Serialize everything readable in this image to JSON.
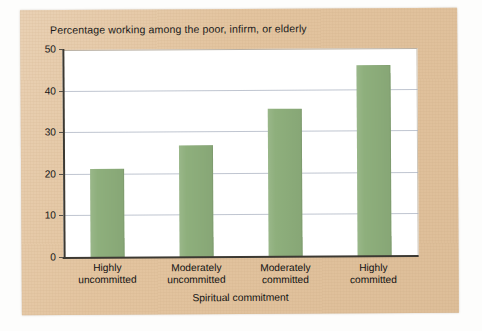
{
  "chart_data": {
    "type": "bar",
    "title": "Percentage working among the poor, infirm, or elderly",
    "xlabel": "Spiritual commitment",
    "ylabel": "",
    "categories": [
      "Highly\nuncommitted",
      "Moderately\nuncommitted",
      "Moderately\ncommitted",
      "Highly\ncommitted"
    ],
    "category_lines": [
      [
        "Highly",
        "uncommitted"
      ],
      [
        "Moderately",
        "uncommitted"
      ],
      [
        "Moderately",
        "committed"
      ],
      [
        "Highly",
        "committed"
      ]
    ],
    "values": [
      21.5,
      27,
      35.5,
      46
    ],
    "ylim": [
      0,
      50
    ],
    "ytick_labels": [
      "0",
      "10",
      "20",
      "30",
      "40",
      "50"
    ],
    "ytick_values": [
      0,
      10,
      20,
      30,
      40,
      50
    ],
    "grid": true,
    "legend": "none",
    "bar_color": "#8eaf7c",
    "plot_background": "#ffffff",
    "card_background": "#e3c49f",
    "gridline_color": "#a9b2c0",
    "axis_color": "#3c3932"
  }
}
